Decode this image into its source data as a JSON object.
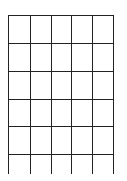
{
  "grid": {
    "line_color": "#222222",
    "background": "#ffffff",
    "columns": 5,
    "rows": 6,
    "x_lines": [
      8,
      30,
      51,
      71,
      92,
      113
    ],
    "y_lines": [
      15,
      43,
      71,
      99,
      126,
      154
    ],
    "top": 15,
    "bottom": 174,
    "open_bottom": true
  }
}
